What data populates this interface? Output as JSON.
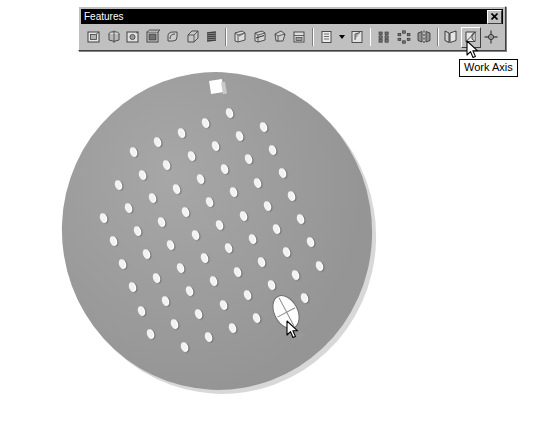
{
  "window": {
    "title": "Features",
    "close_label": "✕",
    "close_icon": "close-icon"
  },
  "toolbar": {
    "name": "Features",
    "buttons": [
      {
        "id": "extrude",
        "label": "Extrude",
        "icon": "extrude-icon"
      },
      {
        "id": "revolve",
        "label": "Revolve",
        "icon": "revolve-icon"
      },
      {
        "id": "hole",
        "label": "Hole",
        "icon": "hole-icon"
      },
      {
        "id": "shell",
        "label": "Shell",
        "icon": "shell-icon"
      },
      {
        "id": "fillet",
        "label": "Fillet",
        "icon": "fillet-icon"
      },
      {
        "id": "chamfer",
        "label": "Chamfer",
        "icon": "chamfer-icon"
      },
      {
        "id": "thread",
        "label": "Thread",
        "icon": "thread-icon"
      },
      {
        "id": "face-draft",
        "label": "Face Draft",
        "icon": "face-draft-icon"
      },
      {
        "id": "split",
        "label": "Split",
        "icon": "split-icon"
      },
      {
        "id": "loft",
        "label": "Loft",
        "icon": "loft-icon"
      },
      {
        "id": "sweep",
        "label": "Sweep",
        "icon": "sweep-icon"
      },
      {
        "id": "coil",
        "label": "Coil",
        "icon": "coil-icon"
      },
      {
        "id": "rib",
        "label": "Rib",
        "icon": "rib-icon"
      },
      {
        "id": "rectangular-pattern",
        "label": "Rectangular Pattern",
        "icon": "rectangular-pattern-icon"
      },
      {
        "id": "circular-pattern",
        "label": "Circular Pattern",
        "icon": "circular-pattern-icon"
      },
      {
        "id": "mirror",
        "label": "Mirror",
        "icon": "mirror-icon"
      },
      {
        "id": "work-plane",
        "label": "Work Plane",
        "icon": "work-plane-icon"
      },
      {
        "id": "work-axis",
        "label": "Work Axis",
        "icon": "work-axis-icon"
      },
      {
        "id": "work-point",
        "label": "Work Point",
        "icon": "work-point-icon"
      }
    ],
    "dropdown_after": "rib",
    "dropdown_icon": "chevron-down-icon",
    "hovered_button": "work-axis"
  },
  "tooltip": {
    "text": "Work Axis",
    "visible": true
  },
  "viewport": {
    "model_name": "perforated-disc",
    "cursor_icon": "arrow-cursor",
    "selection_icon": "work-point-marker",
    "colors": {
      "background": "#ffffff",
      "face": "#9d9d9d",
      "edge": "#d8d8d8",
      "hole": "#f2f2f2",
      "highlight": "#fdfdfd",
      "outline": "#6f6f6f"
    },
    "hole_count": 52
  }
}
